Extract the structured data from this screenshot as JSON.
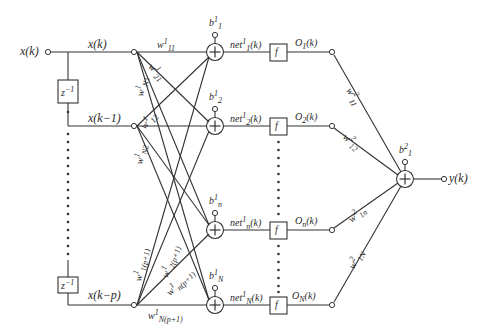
{
  "diagram": {
    "stroke_color": "#333333",
    "background": "#ffffff",
    "input": {
      "signal": "x(k)",
      "taps": [
        {
          "label": "x(k)"
        },
        {
          "label": "x(k−1)"
        },
        {
          "label": "x(k−p)"
        }
      ],
      "delay_label_base": "z",
      "delay_label_exp": "−1"
    },
    "hidden_layer": {
      "biases": [
        {
          "base": "b",
          "sup": "1",
          "sub": "1"
        },
        {
          "base": "b",
          "sup": "1",
          "sub": "2"
        },
        {
          "base": "b",
          "sup": "1",
          "sub": "n"
        },
        {
          "base": "b",
          "sup": "1",
          "sub": "N"
        }
      ],
      "net": [
        {
          "base": "net",
          "sup": "1",
          "sub": "1",
          "arg": "(k)"
        },
        {
          "base": "net",
          "sup": "1",
          "sub": "2",
          "arg": "(k)"
        },
        {
          "base": "net",
          "sup": "1",
          "sub": "n",
          "arg": "(k)"
        },
        {
          "base": "net",
          "sup": "1",
          "sub": "N",
          "arg": "(k)"
        }
      ],
      "activation": "f",
      "outputs": [
        {
          "base": "O",
          "sub": "1",
          "arg": "(k)"
        },
        {
          "base": "O",
          "sub": "2",
          "arg": "(k)"
        },
        {
          "base": "O",
          "sub": "n",
          "arg": "(k)"
        },
        {
          "base": "O",
          "sub": "N",
          "arg": "(k)"
        }
      ]
    },
    "input_weights": [
      {
        "base": "w",
        "sup": "1",
        "sub": "11"
      },
      {
        "base": "w",
        "sup": "1",
        "sub": "21"
      },
      {
        "base": "w",
        "sup": "1",
        "sub": "N1"
      },
      {
        "base": "w",
        "sup": "1",
        "sub": "12"
      },
      {
        "base": "w",
        "sup": "1",
        "sub": "N2"
      },
      {
        "base": "w",
        "sup": "1",
        "sub": "1(p+1)"
      },
      {
        "base": "w",
        "sup": "1",
        "sub": "2(p+1)"
      },
      {
        "base": "w",
        "sup": "1",
        "sub": "n(p+1)"
      },
      {
        "base": "w",
        "sup": "1",
        "sub": "N(p+1)"
      }
    ],
    "output_layer": {
      "bias": {
        "base": "b",
        "sup": "2",
        "sub": "1"
      },
      "weights": [
        {
          "base": "w",
          "sup": "2",
          "sub": "11"
        },
        {
          "base": "w",
          "sup": "2",
          "sub": "12"
        },
        {
          "base": "w",
          "sup": "2",
          "sub": "1n"
        },
        {
          "base": "w",
          "sup": "2",
          "sub": "1N"
        }
      ],
      "output": "y(k)"
    }
  }
}
